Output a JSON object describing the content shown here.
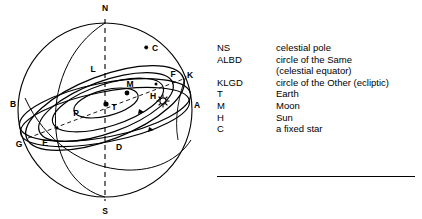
{
  "diagram": {
    "sphere": {
      "outline_color": "#000000",
      "axis_style": "dashed"
    },
    "point_labels": [
      {
        "id": "N",
        "label": "N",
        "x": 105,
        "y": 11,
        "desc": "north celestial pole"
      },
      {
        "id": "S",
        "label": "S",
        "x": 105,
        "y": 212,
        "desc": "south celestial pole"
      },
      {
        "id": "A",
        "label": "A",
        "x": 196,
        "y": 105,
        "desc": "equator right point"
      },
      {
        "id": "B",
        "label": "B",
        "x": 13,
        "y": 104,
        "desc": "equator left point"
      },
      {
        "id": "L",
        "label": "L",
        "x": 92,
        "y": 68,
        "desc": "equator upper node"
      },
      {
        "id": "D",
        "label": "D",
        "x": 118,
        "y": 145,
        "desc": "equator lower node"
      },
      {
        "id": "K",
        "label": "K",
        "x": 189,
        "y": 75,
        "desc": "ecliptic upper right"
      },
      {
        "id": "G",
        "label": "G",
        "x": 18,
        "y": 145,
        "desc": "ecliptic lower left"
      },
      {
        "id": "F",
        "label": "F",
        "x": 172,
        "y": 77,
        "desc": "ecliptic point F"
      },
      {
        "id": "E",
        "label": "E",
        "x": 44,
        "y": 143,
        "desc": "ecliptic point E"
      },
      {
        "id": "P",
        "label": "P",
        "x": 75,
        "y": 113,
        "desc": "lunar orbit point P"
      },
      {
        "id": "T",
        "label": "T",
        "x": 113,
        "y": 107,
        "desc": "Earth at centre"
      },
      {
        "id": "M",
        "label": "M",
        "x": 130,
        "y": 87,
        "desc": "Moon"
      },
      {
        "id": "H",
        "label": "H",
        "x": 154,
        "y": 99,
        "desc": "Sun"
      },
      {
        "id": "C",
        "label": "C",
        "x": 155,
        "y": 50,
        "desc": "a fixed star"
      }
    ],
    "markers": {
      "sun_symbol": "starburst",
      "moon_symbol": "filled-dot",
      "earth_symbol": "filled-dot",
      "star_symbol": "small-star"
    }
  },
  "legend": {
    "rows": [
      {
        "key": "NS",
        "desc": "celestial pole"
      },
      {
        "key": "ALBD",
        "desc": "circle of the Same"
      },
      {
        "key": "",
        "desc": "(celestial equator)"
      },
      {
        "key": "KLGD",
        "desc": "circle of the Other (ecliptic)"
      },
      {
        "key": "T",
        "desc": "Earth"
      },
      {
        "key": "M",
        "desc": "Moon"
      },
      {
        "key": "H",
        "desc": "Sun"
      },
      {
        "key": "C",
        "desc": "a fixed star"
      }
    ]
  }
}
